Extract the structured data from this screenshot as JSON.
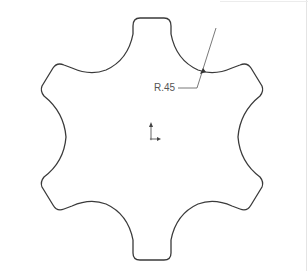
{
  "drawing": {
    "type": "cad-sketch",
    "shape": "six-lobed star profile",
    "stroke_color": "#3a3a3a",
    "background": "#ffffff"
  },
  "dimension": {
    "label": "R.45",
    "kind": "radius",
    "color": "#555555"
  },
  "origin_triad": {
    "icon": "coordinate-axes-icon"
  }
}
